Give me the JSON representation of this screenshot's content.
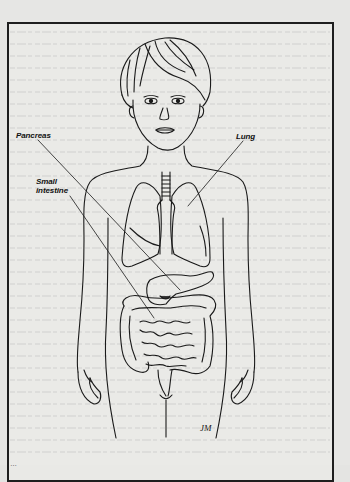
{
  "figure": {
    "type": "anatomical-illustration",
    "labels": {
      "pancreas": "Pancreas",
      "lung": "Lung",
      "small_intestine_line1": "Small",
      "small_intestine_line2": "intestine"
    },
    "signature": "JM",
    "caption": "…"
  },
  "colors": {
    "paper": "#e6e6e4",
    "ink": "#1e1e1e",
    "frame": "#1e1e1e"
  }
}
